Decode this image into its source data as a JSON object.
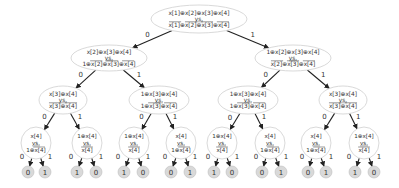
{
  "diagram": {
    "type": "binary-decision-tree",
    "colors": {
      "node_fill": "#ffffff",
      "node_stroke": "#cfcfcf",
      "leaf_fill": "#d9d9d9",
      "edge": "#222222",
      "text": "#333333"
    },
    "nodes": [
      {
        "id": "n0",
        "level": 0,
        "cx": 199,
        "cy": 19,
        "rx": 48,
        "ry": 14,
        "top": "x[1]⊕x[2]⊕x[3]⊕x[4]",
        "vs": "vs.",
        "bottom": "x[1]⊕x[2]⊕x[3]⊕x[4]",
        "bottom_over": [
          0,
          1,
          2,
          3
        ]
      },
      {
        "id": "n1",
        "level": 1,
        "cx": 109,
        "cy": 58,
        "rx": 38,
        "ry": 13,
        "top": "x[2]⊕x[3]⊕x[4]",
        "vs": "vs.",
        "bottom": "1⊕x[2]⊕x[3]⊕x[4]",
        "bottom_over": [
          1,
          2,
          3
        ]
      },
      {
        "id": "n2",
        "level": 1,
        "cx": 293,
        "cy": 58,
        "rx": 38,
        "ry": 13,
        "top": "1⊕x[2]⊕x[3]⊕x[4]",
        "vs": "vs.",
        "bottom": "x[2]⊕x[3]⊕x[4]",
        "bottom_over": [
          0,
          1,
          2
        ]
      },
      {
        "id": "n3",
        "level": 2,
        "cx": 63,
        "cy": 100,
        "rx": 24,
        "ry": 14,
        "top": "x[3]⊕x[4]",
        "vs": "vs.",
        "bottom": "x[3]⊕x[4]",
        "bottom_over": [
          0,
          1
        ]
      },
      {
        "id": "n4",
        "level": 2,
        "cx": 159,
        "cy": 100,
        "rx": 30,
        "ry": 14,
        "top": "1⊕x[3]⊕x[4]",
        "vs": "vs.",
        "bottom": "1⊕x[3]⊕x[4]",
        "bottom_over": [
          1,
          2
        ]
      },
      {
        "id": "n5",
        "level": 2,
        "cx": 248,
        "cy": 100,
        "rx": 30,
        "ry": 14,
        "top": "1⊕x[3]⊕x[4]",
        "vs": "vs.",
        "bottom": "1⊕x[3]⊕x[4]",
        "bottom_over": [
          1,
          2
        ]
      },
      {
        "id": "n6",
        "level": 2,
        "cx": 343,
        "cy": 100,
        "rx": 24,
        "ry": 14,
        "top": "x[3]⊕x[4]",
        "vs": "vs.",
        "bottom": "x[3]⊕x[4]",
        "bottom_over": [
          0,
          1
        ]
      },
      {
        "id": "n7",
        "level": 3,
        "cx": 36,
        "cy": 143,
        "rx": 15,
        "ry": 16,
        "top": "x[4]",
        "vs": "vs.",
        "bottom": "1⊕x[4]",
        "bottom_over": [
          1
        ]
      },
      {
        "id": "n8",
        "level": 3,
        "cx": 87,
        "cy": 143,
        "rx": 15,
        "ry": 16,
        "top": "1⊕x[4]",
        "vs": "vs.",
        "bottom": "x[4]",
        "bottom_over": [
          0
        ]
      },
      {
        "id": "n9",
        "level": 3,
        "cx": 134,
        "cy": 143,
        "rx": 15,
        "ry": 16,
        "top": "1⊕x[4]",
        "vs": "vs.",
        "bottom": "x[4]",
        "bottom_over": [
          0
        ]
      },
      {
        "id": "n10",
        "level": 3,
        "cx": 181,
        "cy": 143,
        "rx": 15,
        "ry": 16,
        "top": "x[4]",
        "vs": "vs.",
        "bottom": "1⊕x[4]",
        "bottom_over": [
          1
        ]
      },
      {
        "id": "n11",
        "level": 3,
        "cx": 222,
        "cy": 143,
        "rx": 15,
        "ry": 16,
        "top": "1⊕x[4]",
        "vs": "vs.",
        "bottom": "x[4]",
        "bottom_over": [
          0
        ]
      },
      {
        "id": "n12",
        "level": 3,
        "cx": 270,
        "cy": 143,
        "rx": 15,
        "ry": 16,
        "top": "x[4]",
        "vs": "vs.",
        "bottom": "1⊕x[4]",
        "bottom_over": [
          1
        ]
      },
      {
        "id": "n13",
        "level": 3,
        "cx": 316,
        "cy": 143,
        "rx": 15,
        "ry": 16,
        "top": "x[4]",
        "vs": "vs.",
        "bottom": "1⊕x[4]",
        "bottom_over": [
          1
        ]
      },
      {
        "id": "n14",
        "level": 3,
        "cx": 364,
        "cy": 143,
        "rx": 15,
        "ry": 16,
        "top": "1⊕x[4]",
        "vs": "vs.",
        "bottom": "x[4]",
        "bottom_over": [
          0
        ]
      }
    ],
    "leaves": [
      {
        "parent": "n7",
        "cx": 28,
        "value": "0"
      },
      {
        "parent": "n7",
        "cx": 45,
        "value": "1"
      },
      {
        "parent": "n8",
        "cx": 77,
        "value": "1"
      },
      {
        "parent": "n8",
        "cx": 96,
        "value": "0"
      },
      {
        "parent": "n9",
        "cx": 124,
        "value": "1"
      },
      {
        "parent": "n9",
        "cx": 143,
        "value": "0"
      },
      {
        "parent": "n10",
        "cx": 171,
        "value": "0"
      },
      {
        "parent": "n10",
        "cx": 190,
        "value": "1"
      },
      {
        "parent": "n11",
        "cx": 214,
        "value": "1"
      },
      {
        "parent": "n11",
        "cx": 232,
        "value": "0"
      },
      {
        "parent": "n12",
        "cx": 262,
        "value": "0"
      },
      {
        "parent": "n12",
        "cx": 281,
        "value": "1"
      },
      {
        "parent": "n13",
        "cx": 308,
        "value": "0"
      },
      {
        "parent": "n13",
        "cx": 326,
        "value": "1"
      },
      {
        "parent": "n14",
        "cx": 355,
        "value": "1"
      },
      {
        "parent": "n14",
        "cx": 374,
        "value": "0"
      }
    ],
    "leaf_cy": 172,
    "leaf_r": 6,
    "edges": [
      {
        "from": "n0",
        "to": "n1",
        "label": "0"
      },
      {
        "from": "n0",
        "to": "n2",
        "label": "1"
      },
      {
        "from": "n1",
        "to": "n3",
        "label": "0"
      },
      {
        "from": "n1",
        "to": "n4",
        "label": "1"
      },
      {
        "from": "n2",
        "to": "n5",
        "label": "0"
      },
      {
        "from": "n2",
        "to": "n6",
        "label": "1"
      },
      {
        "from": "n3",
        "to": "n7",
        "label": "0"
      },
      {
        "from": "n3",
        "to": "n8",
        "label": "1"
      },
      {
        "from": "n4",
        "to": "n9",
        "label": "0"
      },
      {
        "from": "n4",
        "to": "n10",
        "label": "1"
      },
      {
        "from": "n5",
        "to": "n11",
        "label": "0"
      },
      {
        "from": "n5",
        "to": "n12",
        "label": "1"
      },
      {
        "from": "n6",
        "to": "n13",
        "label": "0"
      },
      {
        "from": "n6",
        "to": "n14",
        "label": "1"
      }
    ],
    "leaf_edge_labels": [
      "0",
      "1"
    ]
  }
}
